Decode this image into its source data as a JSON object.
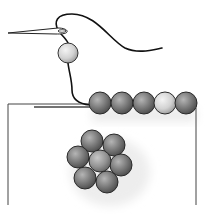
{
  "illustration": {
    "subject": "bead embroidery: needle and thread stitching a row of beads onto fabric, with a flower-shaped bead cluster",
    "colors": {
      "background": "#ffffff",
      "thread": "#111111",
      "outline": "#2a2a2a",
      "bead_dark": "#6e6e6e",
      "bead_mid": "#8c8c8c",
      "bead_light": "#c9c9c9",
      "shadow": "#e6e6e6"
    },
    "needle": {
      "tip": [
        8,
        33
      ],
      "eye": [
        64,
        31
      ]
    },
    "hanging_bead": {
      "cx": 68,
      "cy": 53,
      "r": 10,
      "tone": "light"
    },
    "bead_row": [
      {
        "cx": 100,
        "cy": 103,
        "r": 11,
        "tone": "dark"
      },
      {
        "cx": 122,
        "cy": 103,
        "r": 11,
        "tone": "dark"
      },
      {
        "cx": 144,
        "cy": 103,
        "r": 11,
        "tone": "dark"
      },
      {
        "cx": 165,
        "cy": 103,
        "r": 11,
        "tone": "light"
      },
      {
        "cx": 186,
        "cy": 103,
        "r": 11,
        "tone": "dark"
      }
    ],
    "flower_cluster": [
      {
        "cx": 92,
        "cy": 141,
        "r": 11,
        "tone": "dark"
      },
      {
        "cx": 114,
        "cy": 145,
        "r": 11,
        "tone": "dark"
      },
      {
        "cx": 78,
        "cy": 157,
        "r": 11,
        "tone": "dark"
      },
      {
        "cx": 100,
        "cy": 161,
        "r": 11,
        "tone": "mid"
      },
      {
        "cx": 121,
        "cy": 165,
        "r": 11,
        "tone": "dark"
      },
      {
        "cx": 85,
        "cy": 178,
        "r": 11,
        "tone": "dark"
      },
      {
        "cx": 107,
        "cy": 182,
        "r": 11,
        "tone": "dark"
      }
    ],
    "fabric_edges": {
      "left_x": 8,
      "right_x": 196,
      "top_y": 105,
      "bottom_y": 205
    }
  }
}
